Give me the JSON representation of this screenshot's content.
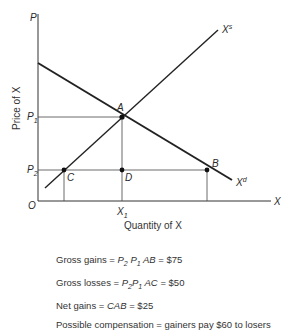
{
  "diagram": {
    "axes": {
      "y_label": "Price of X",
      "x_label": "Quantity of X",
      "y_axis_symbol": "P",
      "x_axis_symbol": "X",
      "origin": "O"
    },
    "curves": {
      "supply": {
        "symbol": "X",
        "superscript": "s"
      },
      "demand": {
        "symbol": "X",
        "superscript": "d"
      }
    },
    "price_ticks": [
      {
        "symbol": "P",
        "sub": "1"
      },
      {
        "symbol": "P",
        "sub": "2"
      }
    ],
    "quantity_ticks": [
      {
        "symbol": "X",
        "sub": "1"
      }
    ],
    "points": [
      "A",
      "B",
      "C",
      "D"
    ]
  },
  "notes": {
    "gross_gains": {
      "label": "Gross gains =",
      "area": [
        "P",
        "2",
        "P",
        "1",
        "AB"
      ],
      "value": "= $75"
    },
    "gross_losses": {
      "label": "Gross losses =",
      "area": [
        "P",
        "2",
        "P",
        "1",
        "AC"
      ],
      "value": "= $50"
    },
    "net_gains": {
      "label": "Net gains =",
      "area": "CAB",
      "value": "= $25"
    },
    "compensation": {
      "text": "Possible compensation = gainers pay $60 to losers"
    }
  }
}
